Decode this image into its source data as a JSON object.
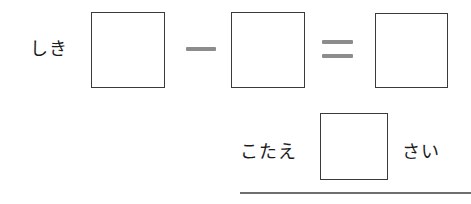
{
  "worksheet": {
    "kind": "japanese-arithmetic-worksheet",
    "background_color": "#ffffff",
    "ink_color": "#1c1c1c",
    "box_border_color": "#3a3a3a",
    "operator_color": "#8c8c8c",
    "rule_color": "#6f6f6f"
  },
  "equation_row": {
    "label": "しき",
    "minus_symbol": "-",
    "equals_symbol": "=",
    "boxes": [
      {
        "name": "minuend",
        "value": ""
      },
      {
        "name": "subtrahend",
        "value": ""
      },
      {
        "name": "result",
        "value": ""
      }
    ]
  },
  "answer_row": {
    "label": "こたえ",
    "unit_label": "さい",
    "box": {
      "name": "answer",
      "value": ""
    }
  },
  "bottom_rule": {
    "visible": true
  }
}
